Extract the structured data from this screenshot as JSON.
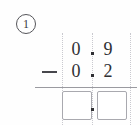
{
  "problem": {
    "number_label": "1",
    "operator_symbol": "−",
    "operator_name": "minus",
    "minuend": {
      "ones": "0",
      "decimal_separator": ".",
      "tenths": "9",
      "value": "0.9"
    },
    "subtrahend": {
      "ones": "0",
      "decimal_separator": ".",
      "tenths": "2",
      "value": "0.2"
    },
    "answer": {
      "ones": "",
      "decimal_separator": ".",
      "tenths": "",
      "placeholder": ""
    }
  },
  "colors": {
    "digit_ink": "#2f2f33",
    "box_border": "#a9a9af",
    "guide_line": "#c9c9cf",
    "rule_line": "#9a9aa0",
    "circle_border": "#55555a",
    "background": "#fefefe"
  }
}
